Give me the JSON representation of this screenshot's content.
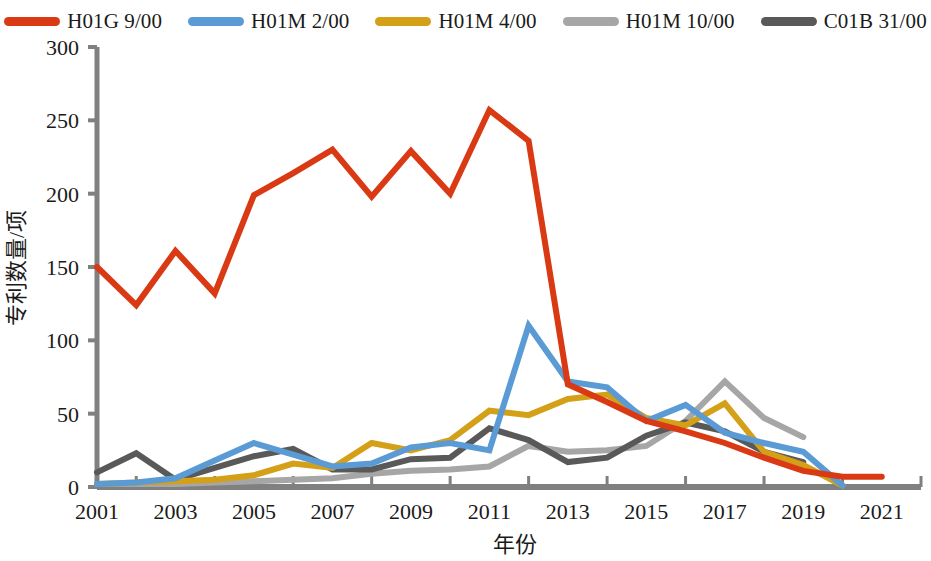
{
  "chart_data": {
    "type": "line",
    "title": "",
    "xlabel": "年份",
    "ylabel": "专利数量/项",
    "xlim": [
      2001,
      2022
    ],
    "ylim": [
      0,
      300
    ],
    "yticks": [
      0,
      50,
      100,
      150,
      200,
      250,
      300
    ],
    "xticks": [
      2001,
      2003,
      2005,
      2007,
      2009,
      2011,
      2013,
      2015,
      2017,
      2019,
      2021
    ],
    "grid": false,
    "legend_position": "top",
    "x": [
      2001,
      2002,
      2003,
      2004,
      2005,
      2006,
      2007,
      2008,
      2009,
      2010,
      2011,
      2012,
      2013,
      2014,
      2015,
      2016,
      2017,
      2018,
      2019,
      2020,
      2021
    ],
    "series": [
      {
        "name": "H01G 9/00",
        "color": "#D93A14",
        "values": [
          150,
          124,
          161,
          132,
          199,
          214,
          230,
          198,
          229,
          200,
          257,
          236,
          70,
          58,
          45,
          38,
          30,
          20,
          11,
          7,
          7
        ]
      },
      {
        "name": "H01M 2/00",
        "color": "#5B9BD5",
        "values": [
          2,
          3,
          6,
          18,
          30,
          22,
          14,
          16,
          27,
          30,
          25,
          110,
          72,
          68,
          45,
          56,
          37,
          30,
          24,
          1,
          null
        ]
      },
      {
        "name": "H01M 4/00",
        "color": "#D4A017",
        "values": [
          2,
          3,
          4,
          5,
          8,
          16,
          13,
          30,
          25,
          32,
          52,
          49,
          60,
          63,
          47,
          42,
          57,
          24,
          15,
          1,
          null
        ]
      },
      {
        "name": "H01M 10/00",
        "color": "#A6A6A6",
        "values": [
          2,
          2,
          2,
          3,
          4,
          5,
          6,
          9,
          11,
          12,
          14,
          28,
          24,
          25,
          28,
          45,
          72,
          47,
          34,
          null,
          null
        ]
      },
      {
        "name": "C01B 31/00",
        "color": "#595959",
        "values": [
          10,
          23,
          5,
          13,
          21,
          26,
          12,
          12,
          19,
          20,
          40,
          32,
          17,
          20,
          35,
          44,
          38,
          24,
          17,
          null,
          null
        ]
      }
    ]
  },
  "legend": {
    "items": [
      {
        "label": "H01G 9/00",
        "color": "#D93A14"
      },
      {
        "label": "H01M 2/00",
        "color": "#5B9BD5"
      },
      {
        "label": "H01M 4/00",
        "color": "#D4A017"
      },
      {
        "label": "H01M 10/00",
        "color": "#A6A6A6"
      },
      {
        "label": "C01B 31/00",
        "color": "#595959"
      }
    ]
  },
  "axes": {
    "y_title": "专利数量/项",
    "x_title": "年份",
    "y_tick_labels": [
      "0",
      "50",
      "100",
      "150",
      "200",
      "250",
      "300"
    ],
    "x_tick_labels": [
      "2001",
      "2003",
      "2005",
      "2007",
      "2009",
      "2011",
      "2013",
      "2015",
      "2017",
      "2019",
      "2021"
    ],
    "axis_color": "#808080"
  }
}
